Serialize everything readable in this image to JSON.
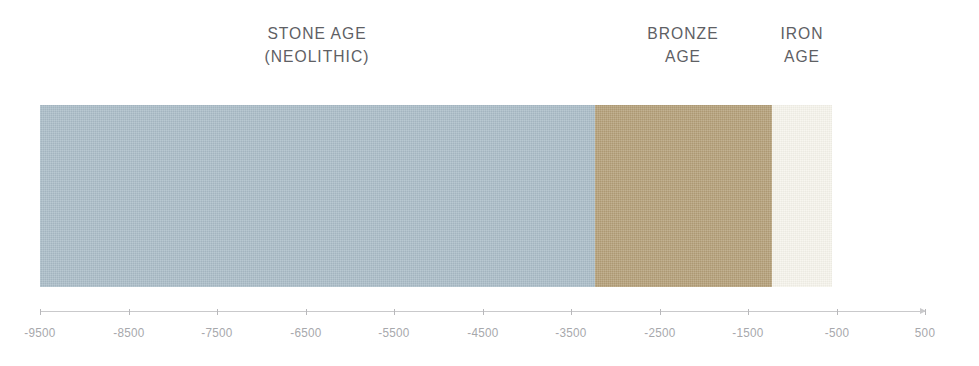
{
  "chart_data": {
    "type": "bar",
    "orientation": "horizontal-timeline",
    "title": "",
    "subtitle": "",
    "xlabel": "",
    "ylabel": "",
    "xlim": [
      -9500,
      500
    ],
    "grid": false,
    "legend": "none",
    "units": "years (negative = BCE)",
    "categories": [
      "STONE AGE (NEOLITHIC)",
      "BRONZE AGE",
      "IRON AGE"
    ],
    "series": [
      {
        "name": "Era duration",
        "values": [
          6270,
          2000,
          680
        ]
      }
    ],
    "annotations": [
      "STONE AGE",
      "(NEOLITHIC)",
      "BRONZE",
      "AGE",
      "IRON",
      "AGE"
    ],
    "bands": [
      {
        "id": "stone-age",
        "label_line1": "STONE AGE",
        "label_line2": "(NEOLITHIC)",
        "start": -9500,
        "end": -3230,
        "duration": 6270,
        "color": "#a9bcc7"
      },
      {
        "id": "bronze-age",
        "label_line1": "BRONZE",
        "label_line2": "AGE",
        "start": -3230,
        "end": -1230,
        "duration": 2000,
        "color": "#b39e77"
      },
      {
        "id": "iron-age",
        "label_line1": "IRON",
        "label_line2": "AGE",
        "start": -1230,
        "end": -550,
        "duration": 680,
        "color": "#f6f4ec"
      }
    ],
    "axis": {
      "tick_values": [
        -9500,
        -8500,
        -7500,
        -6500,
        -5500,
        -4500,
        -3500,
        -2500,
        -1500,
        -500,
        500
      ],
      "tick_labels": [
        "-9500",
        "-8500",
        "-7500",
        "-6500",
        "-5500",
        "-4500",
        "-3500",
        "-2500",
        "-1500",
        "-500",
        "500"
      ],
      "min": -9500,
      "max": 500,
      "step": 1000,
      "line_color": "#c9c9cb",
      "label_color": "#a7a8ac",
      "has_end_arrow": true
    }
  },
  "colors": {
    "background": "#ffffff",
    "stone_age": "#a9bcc7",
    "bronze_age": "#b39e77",
    "iron_age": "#f6f4ec",
    "axis_line": "#c9c9cb",
    "axis_label": "#a7a8ac",
    "era_label": "#5e6064"
  }
}
